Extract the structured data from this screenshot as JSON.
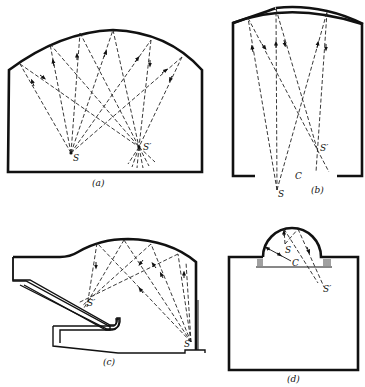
{
  "figure": {
    "panels": [
      {
        "id": "a",
        "caption": "(a)",
        "points": {
          "source": "S",
          "image": "S′"
        }
      },
      {
        "id": "b",
        "caption": "(b)",
        "points": {
          "source": "S",
          "image": "S′",
          "center": "C"
        }
      },
      {
        "id": "c",
        "caption": "(c)",
        "points": {
          "source": "S",
          "image": "S′"
        }
      },
      {
        "id": "d",
        "caption": "(d)",
        "points": {
          "source": "S",
          "image": "S′",
          "center": "C"
        }
      }
    ]
  }
}
